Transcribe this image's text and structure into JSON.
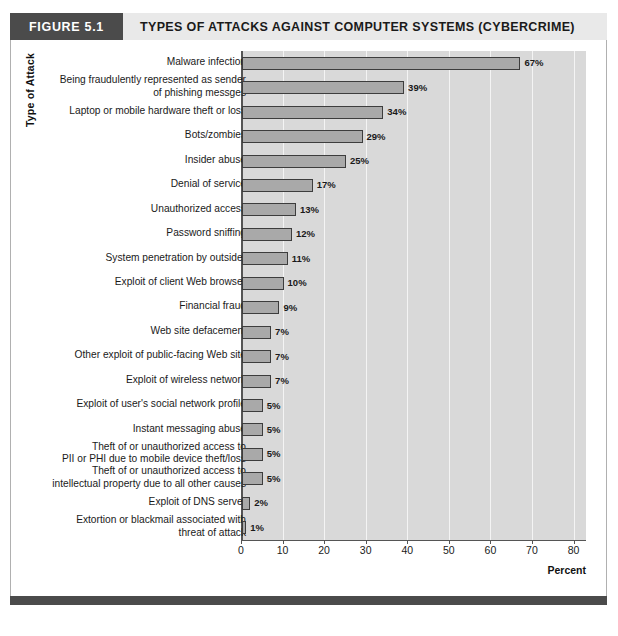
{
  "figure": {
    "badge": "FIGURE 5.1",
    "title": "TYPES OF ATTACKS AGAINST COMPUTER SYSTEMS (CYBERCRIME)"
  },
  "chart_data": {
    "type": "bar",
    "orientation": "horizontal",
    "title": "TYPES OF ATTACKS AGAINST COMPUTER SYSTEMS (CYBERCRIME)",
    "xlabel": "Percent",
    "ylabel": "Type of Attack",
    "xlim": [
      0,
      83
    ],
    "xticks": [
      0,
      10,
      20,
      30,
      40,
      50,
      60,
      70,
      80
    ],
    "xtick_labels": [
      "0",
      "10",
      "20",
      "30",
      "40",
      "50",
      "60",
      "70",
      "80"
    ],
    "grid": "vertical",
    "legend": "none",
    "categories": [
      "Malware infection",
      "Being fraudulently represented as sender\nof phishing messges",
      "Laptop or mobile hardware theft or loss",
      "Bots/zombies",
      "Insider abuse",
      "Denial of service",
      "Unauthorized access",
      "Password sniffing",
      "System penetration by outsider",
      "Exploit of client Web browser",
      "Financial fraud",
      "Web site defacement",
      "Other exploit of public-facing Web site",
      "Exploit of wireless network",
      "Exploit of user's social network profile",
      "Instant messaging abuse",
      "Theft of or unauthorized access to\nPII or PHI due to mobile device theft/loss",
      "Theft of or unauthorized access to\nintellectual property due to all other causes",
      "Exploit of DNS server",
      "Extortion or blackmail associated with\nthreat of attack"
    ],
    "values": [
      67,
      39,
      34,
      29,
      25,
      17,
      13,
      12,
      11,
      10,
      9,
      7,
      7,
      7,
      5,
      5,
      5,
      5,
      2,
      1
    ],
    "value_labels": [
      "67%",
      "39%",
      "34%",
      "29%",
      "25%",
      "17%",
      "13%",
      "12%",
      "11%",
      "10%",
      "9%",
      "7%",
      "7%",
      "7%",
      "5%",
      "5%",
      "5%",
      "5%",
      "2%",
      "1%"
    ],
    "colors": {
      "bar_fill": "#a9a9a9",
      "bar_border": "#3d3d3d",
      "plot_background": "#d9d9d9",
      "gridline": "#f4f4f4",
      "header_badge": "#4b4b4b",
      "header_band": "#e9e9e9"
    }
  }
}
